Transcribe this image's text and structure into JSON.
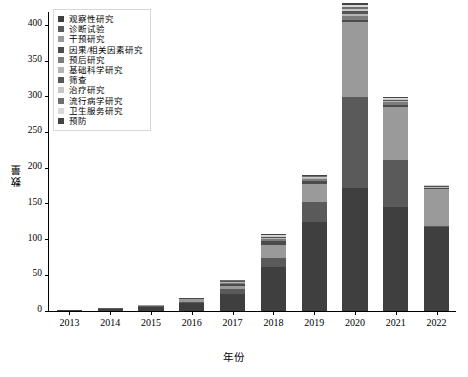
{
  "chart_data": {
    "type": "bar",
    "subtype": "stacked-bar",
    "title": "",
    "xlabel": "年份",
    "ylabel": "数量",
    "categories": [
      "2013",
      "2014",
      "2015",
      "2016",
      "2017",
      "2018",
      "2019",
      "2020",
      "2021",
      "2022"
    ],
    "ylim": [
      0,
      420
    ],
    "yticks": [
      0,
      50,
      100,
      150,
      200,
      250,
      300,
      350,
      400
    ],
    "grid": false,
    "legend_position": "upper-left-inside",
    "series": [
      {
        "name": "观察性研究",
        "color": "#3f3f3f",
        "values": [
          1,
          3,
          6,
          11,
          24,
          62,
          125,
          172,
          146,
          117
        ]
      },
      {
        "name": "诊断试验",
        "color": "#5a5a5a",
        "values": [
          0,
          1,
          1,
          2,
          7,
          12,
          27,
          128,
          66,
          2
        ]
      },
      {
        "name": "干预研究",
        "color": "#9a9a9a",
        "values": [
          0,
          0,
          1,
          4,
          4,
          18,
          26,
          104,
          74,
          52
        ]
      },
      {
        "name": "因果/相关因素研究",
        "color": "#4b4b4b",
        "values": [
          0,
          0,
          0,
          1,
          3,
          6,
          4,
          4,
          3,
          1
        ]
      },
      {
        "name": "预后研究",
        "color": "#7d7d7d",
        "values": [
          0,
          0,
          0,
          0,
          2,
          3,
          3,
          5,
          3,
          1
        ]
      },
      {
        "name": "基础科学研究",
        "color": "#b5b5b5",
        "values": [
          0,
          0,
          0,
          0,
          1,
          2,
          1,
          3,
          2,
          1
        ]
      },
      {
        "name": "筛查",
        "color": "#565656",
        "values": [
          0,
          0,
          0,
          0,
          1,
          1,
          1,
          4,
          2,
          1
        ]
      },
      {
        "name": "治疗研究",
        "color": "#c8c8c8",
        "values": [
          0,
          0,
          0,
          0,
          1,
          1,
          1,
          3,
          1,
          1
        ]
      },
      {
        "name": "流行病学研究",
        "color": "#6e6e6e",
        "values": [
          0,
          0,
          0,
          0,
          1,
          1,
          1,
          3,
          1,
          0
        ]
      },
      {
        "name": "卫生服务研究",
        "color": "#d9d9d9",
        "values": [
          0,
          0,
          0,
          0,
          0,
          1,
          1,
          3,
          1,
          0
        ]
      },
      {
        "name": "预防",
        "color": "#434343",
        "values": [
          0,
          0,
          0,
          0,
          0,
          1,
          1,
          3,
          1,
          0
        ]
      }
    ],
    "totals": [
      1,
      4,
      8,
      18,
      44,
      108,
      191,
      432,
      300,
      176
    ]
  }
}
